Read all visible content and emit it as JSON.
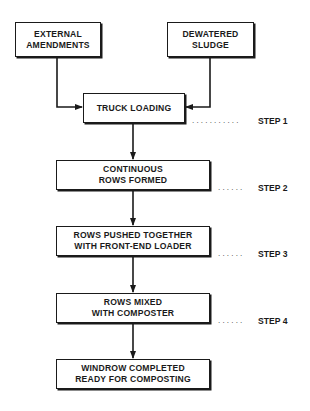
{
  "diagram": {
    "inputs": [
      {
        "id": "external-amendments",
        "lines": [
          "EXTERNAL",
          "AMENDMENTS"
        ]
      },
      {
        "id": "dewatered-sludge",
        "lines": [
          "DEWATERED",
          "SLUDGE"
        ]
      }
    ],
    "process": [
      {
        "id": "truck-loading",
        "lines": [
          "TRUCK LOADING"
        ],
        "step": "STEP 1"
      },
      {
        "id": "continuous-rows-formed",
        "lines": [
          "CONTINUOUS",
          "ROWS FORMED"
        ],
        "step": "STEP 2"
      },
      {
        "id": "rows-pushed-together",
        "lines": [
          "ROWS PUSHED TOGETHER",
          "WITH FRONT-END LOADER"
        ],
        "step": "STEP 3"
      },
      {
        "id": "rows-mixed",
        "lines": [
          "ROWS MIXED",
          "WITH COMPOSTER"
        ],
        "step": "STEP 4"
      },
      {
        "id": "windrow-completed",
        "lines": [
          "WINDROW COMPLETED",
          "READY FOR COMPOSTING"
        ]
      }
    ],
    "leader": "...........",
    "leader_short": "......",
    "colors": {
      "ink": "#1a1a1a",
      "background": "#ffffff"
    }
  }
}
